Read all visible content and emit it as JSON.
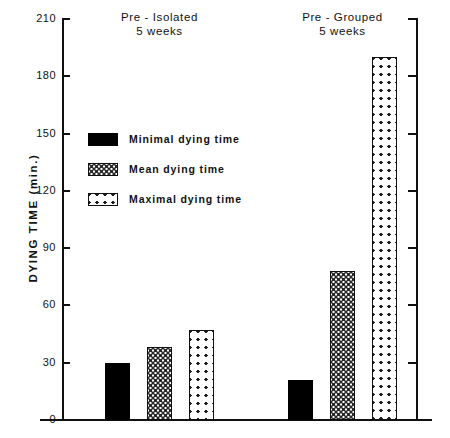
{
  "chart_data": {
    "type": "bar",
    "title": "",
    "xlabel": "",
    "ylabel": "DYING TIME (min.)",
    "ylim": [
      0,
      210
    ],
    "yticks": [
      0,
      30,
      60,
      90,
      120,
      150,
      180,
      210
    ],
    "grid": false,
    "legend_position": "inside-upper-left",
    "categories": [
      "Pre - Isolated\n5 weeks",
      "Pre - Grouped\n5 weeks"
    ],
    "series": [
      {
        "name": "Minimal dying time",
        "values": [
          30,
          21
        ]
      },
      {
        "name": "Mean dying time",
        "values": [
          38,
          78
        ]
      },
      {
        "name": "Maximal dying time",
        "values": [
          47,
          190
        ]
      }
    ]
  },
  "axis": {
    "y_title": "DYING TIME (min.)",
    "ticks": [
      {
        "value": 210,
        "label": "210"
      },
      {
        "value": 180,
        "label": "180"
      },
      {
        "value": 150,
        "label": "150"
      },
      {
        "value": 120,
        "label": "120"
      },
      {
        "value": 90,
        "label": "90"
      },
      {
        "value": 60,
        "label": "60"
      },
      {
        "value": 30,
        "label": "30"
      },
      {
        "value": 0,
        "label": "0"
      }
    ]
  },
  "groups": [
    {
      "id": "pre-isolated",
      "line1": "Pre - Isolated",
      "line2": "5 weeks",
      "bars": [
        {
          "series": "Minimal dying time",
          "value": 30,
          "pattern": "solid-black"
        },
        {
          "series": "Mean dying time",
          "value": 38,
          "pattern": "fine-dot"
        },
        {
          "series": "Maximal dying time",
          "value": 47,
          "pattern": "crosshatch"
        }
      ]
    },
    {
      "id": "pre-grouped",
      "line1": "Pre - Grouped",
      "line2": "5 weeks",
      "bars": [
        {
          "series": "Minimal dying time",
          "value": 21,
          "pattern": "solid-black"
        },
        {
          "series": "Mean dying time",
          "value": 78,
          "pattern": "fine-dot"
        },
        {
          "series": "Maximal dying time",
          "value": 190,
          "pattern": "crosshatch"
        }
      ]
    }
  ],
  "legend": {
    "items": [
      {
        "label": "Minimal dying time",
        "pattern": "solid-black"
      },
      {
        "label": "Mean dying time",
        "pattern": "fine-dot"
      },
      {
        "label": "Maximal dying time",
        "pattern": "crosshatch"
      }
    ]
  },
  "colors": {
    "ink": "#111111",
    "fill_solid": "#000000",
    "fill_background": "#ffffff",
    "page_background": "#ffffff"
  }
}
